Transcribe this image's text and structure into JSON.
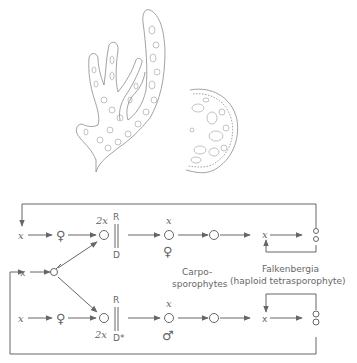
{
  "figure": {
    "illustrations": [
      {
        "name": "branched-thallus-drawing",
        "description": "Branched cellular thallus (gametophyte) line drawing"
      },
      {
        "name": "cystocarp-section-drawing",
        "description": "Half-circular section of carposporophyte with cells"
      }
    ],
    "life_cycle": {
      "labels": {
        "x": "x",
        "two_x": "2x",
        "R": "R",
        "D": "D",
        "D_star": "D*",
        "carposporophytes_line1": "Carpo-",
        "carposporophytes_line2": "sporophytes",
        "falkenbergia_line1": "Falkenbergia",
        "falkenbergia_line2": "(haploid tetrasporophyte)"
      },
      "symbols": {
        "female": "♀",
        "male": "♂"
      },
      "rows": [
        {
          "name": "top-row",
          "sequence": [
            "x",
            "♀",
            "2x zygote",
            "R/D",
            "x ♀ spore",
            "carpospore",
            "x Falkenbergia",
            "tetraspores"
          ]
        },
        {
          "name": "middle-row",
          "sequence": [
            "x",
            "♂"
          ]
        },
        {
          "name": "bottom-row",
          "sequence": [
            "x",
            "♀",
            "2x zygote",
            "R/D*",
            "x ♂ spore",
            "carpospore",
            "x Falkenbergia",
            "tetraspores"
          ]
        }
      ]
    }
  }
}
